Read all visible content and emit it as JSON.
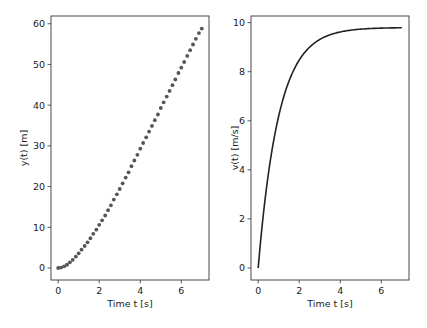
{
  "chart_data": [
    {
      "type": "scatter",
      "title": "",
      "xlabel": "Time t [s]",
      "ylabel": "y(t) [m]",
      "xlim": [
        -0.35,
        7.35
      ],
      "ylim": [
        -2.95,
        61.9
      ],
      "xticks": [
        0,
        2,
        4,
        6
      ],
      "yticks": [
        0,
        10,
        20,
        30,
        40,
        50,
        60
      ],
      "grid": false,
      "legend": null,
      "marker_color": "#555555",
      "model": "y = 9.8*(t - 1 + exp(-t))",
      "x": [
        0.0,
        0.14,
        0.29,
        0.43,
        0.57,
        0.71,
        0.86,
        1.0,
        1.14,
        1.29,
        1.43,
        1.57,
        1.71,
        1.86,
        2.0,
        2.14,
        2.29,
        2.43,
        2.57,
        2.71,
        2.86,
        3.0,
        3.14,
        3.29,
        3.43,
        3.57,
        3.71,
        3.86,
        4.0,
        4.14,
        4.29,
        4.43,
        4.57,
        4.71,
        4.86,
        5.0,
        5.14,
        5.29,
        5.43,
        5.57,
        5.71,
        5.86,
        6.0,
        6.14,
        6.29,
        6.43,
        6.57,
        6.71,
        6.86,
        7.0
      ],
      "values": [
        0.0,
        0.1,
        0.4,
        0.8,
        1.4,
        2.0,
        2.8,
        3.6,
        4.5,
        5.4,
        6.3,
        7.3,
        8.4,
        9.4,
        10.6,
        11.7,
        12.9,
        14.2,
        15.4,
        16.8,
        18.1,
        19.4,
        20.8,
        22.2,
        23.5,
        25.0,
        26.4,
        27.8,
        29.3,
        30.7,
        32.1,
        33.5,
        34.9,
        36.3,
        37.7,
        39.3,
        40.7,
        42.1,
        43.5,
        44.9,
        46.3,
        47.9,
        49.2,
        50.6,
        52.1,
        53.5,
        54.9,
        56.3,
        57.7,
        58.8
      ]
    },
    {
      "type": "line",
      "title": "",
      "xlabel": "Time t [s]",
      "ylabel": "v(t) [m/s]",
      "xlim": [
        -0.35,
        7.35
      ],
      "ylim": [
        -0.49,
        10.27
      ],
      "xticks": [
        0,
        2,
        4,
        6
      ],
      "yticks": [
        0,
        2,
        4,
        6,
        8,
        10
      ],
      "grid": false,
      "legend": null,
      "line_color": "#222222",
      "model": "v = 9.8*(1 - exp(-t))",
      "x": [
        0,
        0.25,
        0.5,
        0.75,
        1,
        1.5,
        2,
        2.5,
        3,
        3.5,
        4,
        4.5,
        5,
        5.5,
        6,
        6.5,
        7
      ],
      "values": [
        0,
        2.17,
        3.86,
        5.17,
        6.19,
        7.61,
        8.47,
        8.99,
        9.31,
        9.5,
        9.62,
        9.69,
        9.73,
        9.76,
        9.78,
        9.79,
        9.79
      ]
    }
  ]
}
